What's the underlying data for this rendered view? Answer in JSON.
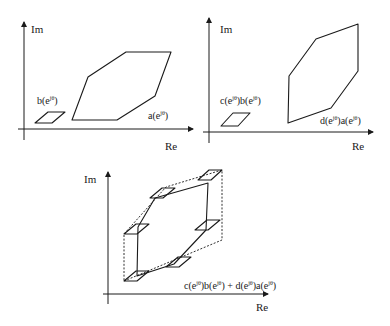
{
  "panels": [
    {
      "id": "top-left",
      "axis_labels": {
        "imag": "Im",
        "real": "Re"
      },
      "shapes": [
        {
          "name": "b-parallelogram",
          "label_func": "b",
          "label_arg": "(e",
          "label_sup": "jθ",
          "label_close": ")"
        },
        {
          "name": "a-hexagon",
          "label_func": "a",
          "label_arg": "(e",
          "label_sup": "jθ",
          "label_close": ")"
        }
      ]
    },
    {
      "id": "top-right",
      "axis_labels": {
        "imag": "Im",
        "real": "Re"
      },
      "shapes": [
        {
          "name": "cb-parallelogram",
          "label_parts": [
            "c(e",
            "jθ",
            ")b(e",
            "jθ",
            ")"
          ]
        },
        {
          "name": "da-hexagon",
          "label_parts": [
            "d(e",
            "jθ",
            ")a(e",
            "jθ",
            ")"
          ]
        }
      ]
    },
    {
      "id": "bottom",
      "axis_labels": {
        "imag": "Im",
        "real": "Re"
      },
      "sum_label_parts": [
        "c(e",
        "jθ",
        ")b(e",
        "jθ",
        ") + d(e",
        "jθ",
        ")a(e",
        "jθ",
        ")"
      ]
    }
  ]
}
